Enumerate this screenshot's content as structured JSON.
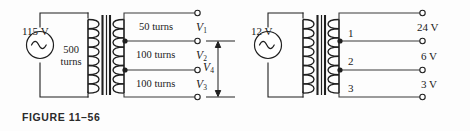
{
  "page": {
    "width": 470,
    "height": 131,
    "background": "#fdfdfd",
    "ink": "#1a1a1a"
  },
  "figures": [
    {
      "id": "figure-11-56",
      "caption": "FIGURE 11–56",
      "source": {
        "label": "115 V",
        "type": "ac-voltage-source"
      },
      "primary": {
        "turns_label_line1": "500",
        "turns_label_line2": "turns"
      },
      "secondary_sections": [
        {
          "turns_label": "50 turns"
        },
        {
          "turns_label": "100 turns"
        },
        {
          "turns_label": "100 turns"
        }
      ],
      "terminal_labels": [
        {
          "text": "V",
          "sub": "1"
        },
        {
          "text": "V",
          "sub": "2"
        },
        {
          "text": "V",
          "sub": "3"
        }
      ],
      "measurement": {
        "text": "V",
        "sub": "4"
      },
      "terminal_count": 4,
      "tap_count": 2
    },
    {
      "id": "figure-11-57",
      "caption": "FIGURE 11–57",
      "source": {
        "label": "12 V",
        "type": "ac-voltage-source"
      },
      "tap_numbers": [
        "1",
        "2",
        "3"
      ],
      "output_voltages": [
        "24 V",
        "6 V",
        "3 V"
      ],
      "terminal_count": 4,
      "tap_count": 2
    }
  ]
}
